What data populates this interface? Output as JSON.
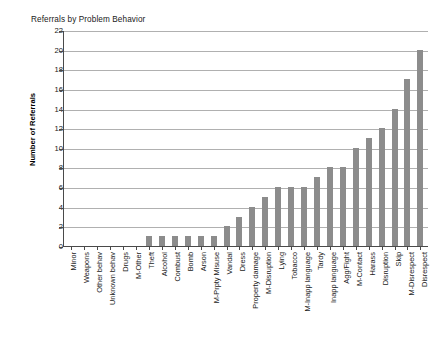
{
  "chart_data": {
    "type": "bar",
    "title": "Referrals by Problem Behavior",
    "xlabel": "",
    "ylabel": "Number of Referrals",
    "ylim": [
      0,
      22
    ],
    "ytick_step": 2,
    "yticks": [
      22,
      20,
      18,
      16,
      14,
      12,
      10,
      8,
      6,
      4,
      2,
      0
    ],
    "grid": "horizontal",
    "legend": "none",
    "bar_color": "#8c8c8c",
    "plot_background": "#ffffff",
    "axis_color": "#4a4a4a",
    "gridline_color": "#b0b0b0",
    "categories": [
      "Minor",
      "Weapons",
      "Other behav",
      "Unknown behav",
      "Drugs",
      "M-Other",
      "Theft",
      "Alcohol",
      "Combust",
      "Bomb",
      "Arson",
      "M-Prpty Misuse",
      "Vandal",
      "Dress",
      "Property damage",
      "M-Disruption",
      "Lying",
      "Tobacco",
      "M-Inapp language",
      "Tardy",
      "Inapp language",
      "Agg/Fight",
      "M-Contact",
      "Harass",
      "Disruption",
      "Skip",
      "M-Disrespect",
      "Disrespect"
    ],
    "values": [
      0,
      0,
      0,
      0,
      0,
      0,
      1,
      1,
      1,
      1,
      1,
      1,
      2,
      3,
      4,
      5,
      6,
      6,
      6,
      7,
      8,
      8,
      10,
      11,
      12,
      14,
      17,
      20
    ]
  }
}
